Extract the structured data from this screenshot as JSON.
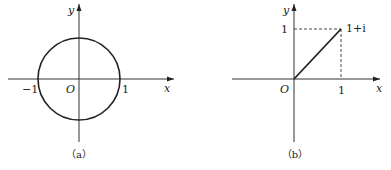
{
  "figures": [
    {
      "id": "a",
      "caption": "（a）",
      "description": "Unit circle centered at the origin in the complex plane",
      "axes": {
        "x_label": "x",
        "y_label": "y",
        "origin_label": "O"
      },
      "ticks": {
        "x_neg": "−1",
        "x_pos": "1"
      },
      "shape": {
        "type": "circle",
        "center": [
          0,
          0
        ],
        "radius": 1
      }
    },
    {
      "id": "b",
      "caption": "（b）",
      "description": "Segment from origin to the point 1+i with dashed projections",
      "axes": {
        "x_label": "x",
        "y_label": "y",
        "origin_label": "O"
      },
      "ticks": {
        "x_pos": "1",
        "y_pos": "1"
      },
      "point": {
        "label": "1+i",
        "coords": [
          1,
          1
        ]
      },
      "shape": {
        "type": "segment",
        "from": [
          0,
          0
        ],
        "to": [
          1,
          1
        ]
      }
    }
  ],
  "colors": {
    "stroke": "#222222",
    "background": "#ffffff"
  }
}
